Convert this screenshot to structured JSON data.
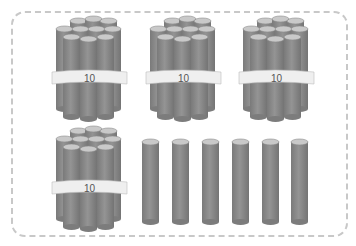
{
  "diagram": {
    "bundle_label": "10",
    "bundles": [
      {
        "x": 50,
        "y": 18,
        "label": "10"
      },
      {
        "x": 144,
        "y": 18,
        "label": "10"
      },
      {
        "x": 237,
        "y": 18,
        "label": "10"
      },
      {
        "x": 50,
        "y": 128,
        "label": "10"
      }
    ],
    "single_rods": [
      {
        "x": 142
      },
      {
        "x": 172
      },
      {
        "x": 202
      },
      {
        "x": 232
      },
      {
        "x": 262
      },
      {
        "x": 291
      }
    ],
    "counts": {
      "bundles": 4,
      "ones": 6
    },
    "colors": {
      "rod_body": "#8c8c8c",
      "rod_shadow": "#747474",
      "rod_cap": "#c9c9c9",
      "band": "#efefef",
      "border": "#c8c8c8"
    }
  }
}
